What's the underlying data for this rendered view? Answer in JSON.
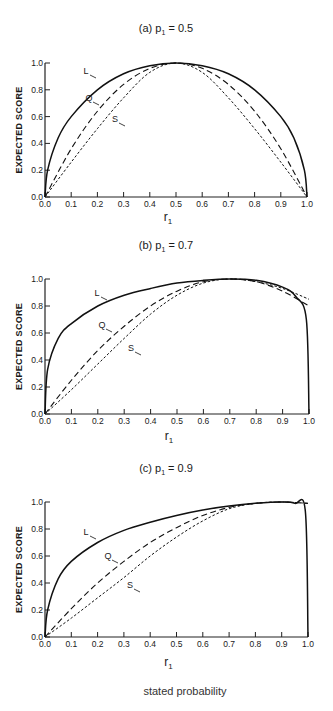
{
  "figure": {
    "footer_label": "stated probability"
  },
  "chart_data": [
    {
      "type": "line",
      "title": "(a) p1 = 0.5",
      "title_prefix": "(a) p",
      "title_sub": "1",
      "title_suffix": " = 0.5",
      "p": 0.5,
      "xlabel": "r1",
      "xlabel_main": "r",
      "xlabel_sub": "1",
      "ylabel": "EXPECTED SCORE",
      "xlim": [
        0,
        1
      ],
      "ylim": [
        0,
        1
      ],
      "xticks": [
        "0.0",
        "0.1",
        "0.2",
        "0.3",
        "0.4",
        "0.5",
        "0.6",
        "0.7",
        "0.8",
        "0.9",
        "1.0"
      ],
      "yticks": [
        "0.0",
        "0.2",
        "0.4",
        "0.6",
        "0.8",
        "1.0"
      ],
      "grid": false,
      "series": [
        {
          "name": "L",
          "label": "L",
          "style": "solid",
          "description": "logarithmic scoring rule",
          "x": [
            0,
            0.01,
            0.05,
            0.1,
            0.2,
            0.3,
            0.4,
            0.5,
            0.6,
            0.7,
            0.8,
            0.9,
            0.95,
            0.99,
            1
          ],
          "y": [
            0,
            0.2,
            0.44,
            0.6,
            0.8,
            0.92,
            0.98,
            1.0,
            0.98,
            0.92,
            0.8,
            0.6,
            0.44,
            0.2,
            0
          ]
        },
        {
          "name": "Q",
          "label": "Q",
          "style": "dashed",
          "description": "quadratic scoring rule",
          "x": [
            0,
            0.1,
            0.2,
            0.3,
            0.4,
            0.5,
            0.6,
            0.7,
            0.8,
            0.9,
            1
          ],
          "y": [
            0,
            0.36,
            0.64,
            0.84,
            0.96,
            1.0,
            0.96,
            0.84,
            0.64,
            0.36,
            0
          ]
        },
        {
          "name": "S",
          "label": "S",
          "style": "dotted",
          "description": "spherical scoring rule",
          "x": [
            0,
            0.1,
            0.2,
            0.3,
            0.4,
            0.5,
            0.6,
            0.7,
            0.8,
            0.9,
            1
          ],
          "y": [
            0,
            0.26,
            0.51,
            0.74,
            0.93,
            1.0,
            0.93,
            0.74,
            0.51,
            0.26,
            0
          ]
        }
      ]
    },
    {
      "type": "line",
      "title": "(b) p1 = 0.7",
      "title_prefix": "(b) p",
      "title_sub": "1",
      "title_suffix": " = 0.7",
      "p": 0.7,
      "xlabel": "r1",
      "xlabel_main": "r",
      "xlabel_sub": "1",
      "ylabel": "EXPECTED SCORE",
      "xlim": [
        0,
        1
      ],
      "ylim": [
        0,
        1
      ],
      "xticks": [
        "0.0",
        "0.1",
        "0.2",
        "0.3",
        "0.4",
        "0.5",
        "0.6",
        "0.7",
        "0.8",
        "0.9",
        "1.0"
      ],
      "yticks": [
        "0.0",
        "0.2",
        "0.4",
        "0.6",
        "0.8",
        "1.0"
      ],
      "grid": false,
      "series": [
        {
          "name": "L",
          "label": "L",
          "style": "solid",
          "x": [
            0,
            0.01,
            0.05,
            0.1,
            0.2,
            0.3,
            0.4,
            0.5,
            0.6,
            0.7,
            0.8,
            0.9,
            0.95,
            0.99,
            1
          ],
          "y": [
            0,
            0.33,
            0.56,
            0.67,
            0.8,
            0.88,
            0.93,
            0.97,
            0.99,
            1.0,
            0.99,
            0.94,
            0.87,
            0.7,
            0
          ]
        },
        {
          "name": "Q",
          "label": "Q",
          "style": "dashed",
          "x": [
            0,
            0.1,
            0.2,
            0.3,
            0.4,
            0.5,
            0.6,
            0.7,
            0.8,
            0.9,
            1
          ],
          "y": [
            0,
            0.25,
            0.47,
            0.65,
            0.8,
            0.91,
            0.98,
            1.0,
            0.98,
            0.91,
            0.8
          ]
        },
        {
          "name": "S",
          "label": "S",
          "style": "dotted",
          "x": [
            0,
            0.1,
            0.2,
            0.3,
            0.4,
            0.5,
            0.6,
            0.7,
            0.8,
            0.9,
            1
          ],
          "y": [
            0,
            0.18,
            0.37,
            0.56,
            0.74,
            0.88,
            0.97,
            1.0,
            0.98,
            0.93,
            0.85
          ]
        }
      ]
    },
    {
      "type": "line",
      "title": "(c) p1 = 0.9",
      "title_prefix": "(c) p",
      "title_sub": "1",
      "title_suffix": " = 0.9",
      "p": 0.9,
      "xlabel": "r1",
      "xlabel_main": "r",
      "xlabel_sub": "1",
      "ylabel": "EXPECTED SCORE",
      "xlim": [
        0,
        1
      ],
      "ylim": [
        0,
        1
      ],
      "xticks": [
        "0.0",
        "0.1",
        "0.2",
        "0.3",
        "0.4",
        "0.5",
        "0.6",
        "0.7",
        "0.8",
        "0.9",
        "1.0"
      ],
      "yticks": [
        "0.0",
        "0.2",
        "0.4",
        "0.6",
        "0.8",
        "1.0"
      ],
      "grid": false,
      "series": [
        {
          "name": "L",
          "label": "L",
          "style": "solid",
          "x": [
            0,
            0.01,
            0.05,
            0.1,
            0.2,
            0.3,
            0.4,
            0.5,
            0.6,
            0.7,
            0.8,
            0.9,
            0.95,
            0.99,
            1
          ],
          "y": [
            0,
            0.2,
            0.43,
            0.56,
            0.7,
            0.79,
            0.85,
            0.9,
            0.94,
            0.97,
            0.99,
            1.0,
            0.99,
            0.93,
            0
          ]
        },
        {
          "name": "Q",
          "label": "Q",
          "style": "dashed",
          "x": [
            0,
            0.1,
            0.2,
            0.3,
            0.4,
            0.5,
            0.6,
            0.7,
            0.8,
            0.9,
            1
          ],
          "y": [
            0,
            0.21,
            0.4,
            0.56,
            0.7,
            0.81,
            0.9,
            0.96,
            0.99,
            1.0,
            0.99
          ]
        },
        {
          "name": "S",
          "label": "S",
          "style": "dotted",
          "x": [
            0,
            0.1,
            0.2,
            0.3,
            0.4,
            0.5,
            0.6,
            0.7,
            0.8,
            0.9,
            1
          ],
          "y": [
            0,
            0.14,
            0.29,
            0.44,
            0.6,
            0.74,
            0.86,
            0.95,
            0.99,
            1.0,
            0.99
          ]
        }
      ]
    }
  ]
}
